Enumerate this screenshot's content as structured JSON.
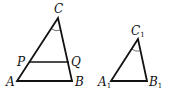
{
  "figure": {
    "triangle_1": {
      "vertices": {
        "C": {
          "label": "C",
          "x": 58,
          "y": 18
        },
        "A": {
          "label": "A",
          "x": 17,
          "y": 81
        },
        "B": {
          "label": "B",
          "x": 72,
          "y": 81
        }
      },
      "segment": {
        "P": {
          "label": "P",
          "x": 30,
          "y": 62
        },
        "Q": {
          "label": "Q",
          "x": 69,
          "y": 62
        }
      },
      "angle_mark": "C"
    },
    "triangle_2": {
      "vertices": {
        "C1": {
          "label": "C",
          "sub": "1",
          "x": 138,
          "y": 39
        },
        "A1": {
          "label": "A",
          "sub": "1",
          "x": 111,
          "y": 81
        },
        "B1": {
          "label": "B",
          "sub": "1",
          "x": 147,
          "y": 81
        }
      },
      "angle_mark": "C1"
    },
    "colors": {
      "stroke": "#111111",
      "background": "#ffffff"
    }
  }
}
